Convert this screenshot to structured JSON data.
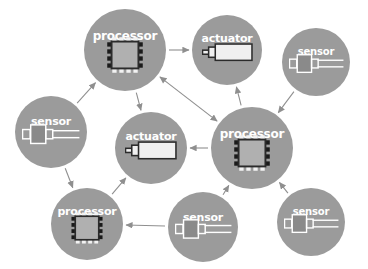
{
  "diagram": {
    "background_color": "#ffffff",
    "node_color": "#9b9b9b",
    "label_color": "#ffffff",
    "edge_color": "#8f8f8f",
    "chip_body_color": "#b0b0b0",
    "chip_outline_color": "#2b2b2b",
    "chip_pin_dark_color": "#1a1a1a",
    "chip_pin_light_color": "#f2f2f2",
    "sensor_body_color": "#8a8a8a",
    "sensor_outline_color": "#ffffff",
    "actuator_body_color": "#f0f0f0",
    "actuator_outline_color": "#2b2b2b",
    "nodes": [
      {
        "id": "processor-top",
        "label": "processor",
        "icon": "chip-icon",
        "cx": 125,
        "cy": 50,
        "r": 41,
        "label_dy": -20
      },
      {
        "id": "actuator-top",
        "label": "actuator",
        "icon": "actuator-icon",
        "cx": 227,
        "cy": 50,
        "r": 35,
        "label_dy": -17
      },
      {
        "id": "sensor-top-right",
        "label": "sensor",
        "icon": "sensor-icon",
        "cx": 316,
        "cy": 62,
        "r": 34,
        "label_dy": -15
      },
      {
        "id": "sensor-left",
        "label": "sensor",
        "icon": "sensor-icon",
        "cx": 51,
        "cy": 132,
        "r": 36,
        "label_dy": -16
      },
      {
        "id": "actuator-middle",
        "label": "actuator",
        "icon": "actuator-icon",
        "cx": 151,
        "cy": 148,
        "r": 36,
        "label_dy": -17
      },
      {
        "id": "processor-center",
        "label": "processor",
        "icon": "chip-icon",
        "cx": 252,
        "cy": 148,
        "r": 41,
        "label_dy": -20
      },
      {
        "id": "processor-bottom-left",
        "label": "processor",
        "icon": "chip-icon",
        "cx": 87,
        "cy": 224,
        "r": 36,
        "label_dy": -18
      },
      {
        "id": "sensor-bottom",
        "label": "sensor",
        "icon": "sensor-icon",
        "cx": 203,
        "cy": 227,
        "r": 35,
        "label_dy": -15
      },
      {
        "id": "sensor-bottom-right",
        "label": "sensor",
        "icon": "sensor-icon",
        "cx": 311,
        "cy": 222,
        "r": 34,
        "label_dy": -15
      }
    ],
    "edges": [
      {
        "id": "edge-sensor-left-to-processor-top",
        "from": "sensor-left",
        "to": "processor-top",
        "arrow": "forward"
      },
      {
        "id": "edge-processor-top-to-actuator-top",
        "from": "processor-top",
        "to": "actuator-top",
        "arrow": "forward"
      },
      {
        "id": "edge-processor-top-to-actuator-middle",
        "from": "processor-top",
        "to": "actuator-middle",
        "arrow": "forward"
      },
      {
        "id": "edge-processor-top-processor-center",
        "from": "processor-top",
        "to": "processor-center",
        "arrow": "both"
      },
      {
        "id": "edge-processor-center-to-actuator-top",
        "from": "processor-center",
        "to": "actuator-top",
        "arrow": "forward"
      },
      {
        "id": "edge-processor-center-to-actuator-middle",
        "from": "processor-center",
        "to": "actuator-middle",
        "arrow": "forward"
      },
      {
        "id": "edge-sensor-top-right-to-processor-center",
        "from": "sensor-top-right",
        "to": "processor-center",
        "arrow": "forward"
      },
      {
        "id": "edge-sensor-bottom-right-to-processor-center",
        "from": "sensor-bottom-right",
        "to": "processor-center",
        "arrow": "forward"
      },
      {
        "id": "edge-sensor-bottom-to-processor-center",
        "from": "sensor-bottom",
        "to": "processor-center",
        "arrow": "forward"
      },
      {
        "id": "edge-sensor-bottom-to-processor-bottom-left",
        "from": "sensor-bottom",
        "to": "processor-bottom-left",
        "arrow": "forward"
      },
      {
        "id": "edge-sensor-left-to-processor-bottom-left",
        "from": "sensor-left",
        "to": "processor-bottom-left",
        "arrow": "forward"
      },
      {
        "id": "edge-processor-bottom-left-to-actuator-middle",
        "from": "processor-bottom-left",
        "to": "actuator-middle",
        "arrow": "forward"
      }
    ]
  }
}
